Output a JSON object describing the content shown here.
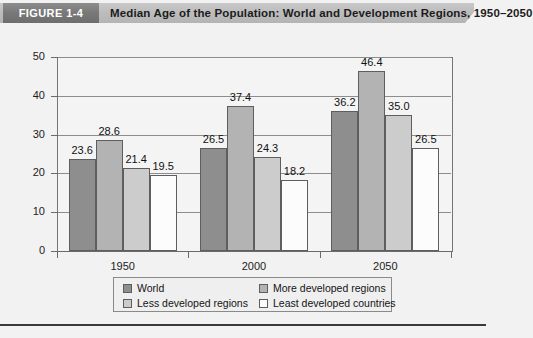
{
  "header": {
    "badge": "FIGURE 1-4",
    "title": "Median Age of the Population: World and Development Regions, 1950–2050"
  },
  "chart_data": {
    "type": "bar",
    "title": "Median Age of the Population: World and Development Regions, 1950–2050",
    "xlabel": "",
    "ylabel": "",
    "ylim": [
      0,
      50
    ],
    "yticks": [
      0,
      10,
      20,
      30,
      40,
      50
    ],
    "ytick_labels": [
      "0",
      "10",
      "20",
      "30",
      "40",
      "50"
    ],
    "grid": true,
    "legend_position": "bottom",
    "categories": [
      "1950",
      "2000",
      "2050"
    ],
    "series": [
      {
        "name": "World",
        "color": "#8e8e8e",
        "values": [
          23.6,
          26.5,
          36.2
        ],
        "labels": [
          "23.6",
          "26.5",
          "36.2"
        ]
      },
      {
        "name": "More developed regions",
        "color": "#b3b3b3",
        "values": [
          28.6,
          37.4,
          46.4
        ],
        "labels": [
          "28.6",
          "37.4",
          "46.4"
        ]
      },
      {
        "name": "Less developed regions",
        "color": "#cccccc",
        "values": [
          21.4,
          24.3,
          35.0
        ],
        "labels": [
          "21.4",
          "24.3",
          "35.0"
        ]
      },
      {
        "name": "Least developed countries",
        "color": "#fcfcfc",
        "values": [
          19.5,
          18.2,
          26.5
        ],
        "labels": [
          "19.5",
          "18.2",
          "26.5"
        ]
      }
    ]
  },
  "legend": {
    "items": [
      {
        "label": "World",
        "color": "#8e8e8e"
      },
      {
        "label": "More developed regions",
        "color": "#b3b3b3"
      },
      {
        "label": "Less developed regions",
        "color": "#cccccc"
      },
      {
        "label": "Least developed countries",
        "color": "#fcfcfc"
      }
    ]
  }
}
